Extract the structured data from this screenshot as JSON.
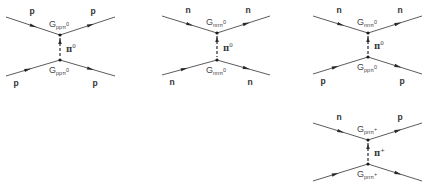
{
  "diagrams": [
    {
      "name": "pp-scattering-pi0",
      "top": {
        "in": "p",
        "out": "p",
        "coupling": {
          "base": "G",
          "sub": "ppπ",
          "sub_sup": "0"
        }
      },
      "exchange": {
        "symbol": "π",
        "charge": "0"
      },
      "bottom": {
        "in": "p",
        "out": "p",
        "coupling": {
          "base": "G",
          "sub": "ppπ",
          "sub_sup": "0"
        }
      }
    },
    {
      "name": "nn-scattering-pi0",
      "top": {
        "in": "n",
        "out": "n",
        "coupling": {
          "base": "G",
          "sub": "nnπ",
          "sub_sup": "0"
        }
      },
      "exchange": {
        "symbol": "π",
        "charge": "0"
      },
      "bottom": {
        "in": "n",
        "out": "n",
        "coupling": {
          "base": "G",
          "sub": "nnπ",
          "sub_sup": "0"
        }
      }
    },
    {
      "name": "np-scattering-pi0",
      "top": {
        "in": "n",
        "out": "n",
        "coupling": {
          "base": "G",
          "sub": "nnπ",
          "sub_sup": "0"
        }
      },
      "exchange": {
        "symbol": "π",
        "charge": "0"
      },
      "bottom": {
        "in": "p",
        "out": "p",
        "coupling": {
          "base": "G",
          "sub": "ppπ",
          "sub_sup": "0"
        }
      }
    },
    {
      "name": "np-charge-exchange-pi-plus",
      "top": {
        "in": "n",
        "out": "p",
        "coupling": {
          "base": "G",
          "sub": "pnπ",
          "sub_sup": "+"
        }
      },
      "exchange": {
        "symbol": "π",
        "charge": "+"
      },
      "bottom": {
        "in": "p",
        "out": "n",
        "coupling": {
          "base": "G",
          "sub": "pnπ",
          "sub_sup": "+"
        }
      }
    }
  ]
}
